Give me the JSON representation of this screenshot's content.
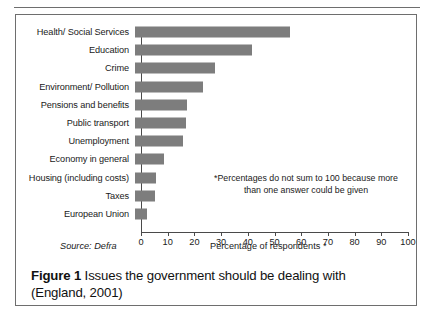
{
  "figure": {
    "caption_label": "Figure 1",
    "caption_text": " Issues the government should be dealing with (England, 2001)",
    "source": "Source: Defra",
    "note": "*Percentages do not sum to 100 because more than one answer could be given"
  },
  "chart_data": {
    "type": "bar",
    "orientation": "horizontal",
    "title": "",
    "xlabel": "Percentage of respondents *",
    "ylabel": "",
    "xlim": [
      0,
      100
    ],
    "xticks": [
      0,
      10,
      20,
      30,
      40,
      50,
      60,
      70,
      80,
      90,
      100
    ],
    "grid": false,
    "legend": false,
    "bar_color": "#7d7d7d",
    "axis_color": "#4a4a4a",
    "categories": [
      "Health/ Social Services",
      "Education",
      "Crime",
      "Environment/ Pollution",
      "Pensions and benefits",
      "Public transport",
      "Unemployment",
      "Economy in general",
      "Housing (including costs)",
      "Taxes",
      "European Union"
    ],
    "values": [
      58,
      44,
      30,
      25.5,
      19.5,
      19,
      18,
      11,
      8,
      7.5,
      4.5
    ]
  }
}
